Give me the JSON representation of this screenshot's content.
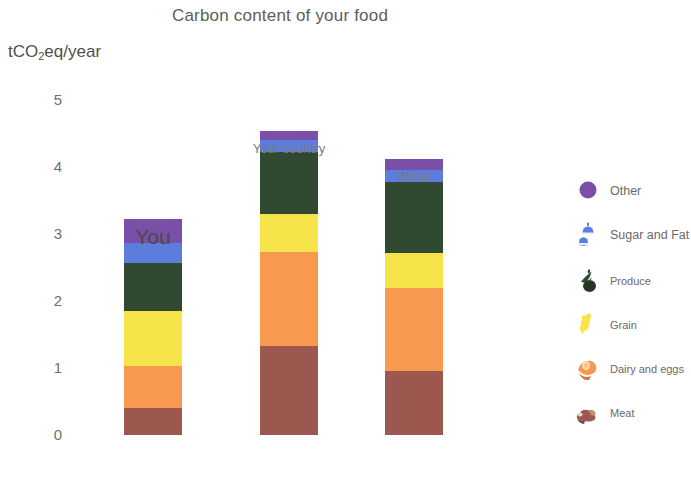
{
  "chart_data": {
    "type": "bar",
    "subtype": "stacked-bar",
    "title": "Carbon content of your food",
    "xlabel": "",
    "ylabel": "tCO2eq/year",
    "ylabel_parts": {
      "pre": "tCO",
      "sub": "2",
      "post": "eq/year"
    },
    "categories": [
      "You",
      "Your country",
      "World"
    ],
    "yticks": [
      0,
      1,
      2,
      3,
      4,
      5
    ],
    "ylim": [
      0,
      5
    ],
    "grid": false,
    "legend_position": "right",
    "stack_order_bottom_to_top": [
      "Meat",
      "Dairy and eggs",
      "Grain",
      "Produce",
      "Sugar and Fat",
      "Other"
    ],
    "series": [
      {
        "name": "Meat",
        "color": "#9c584f",
        "values": [
          0.4,
          1.33,
          0.95
        ]
      },
      {
        "name": "Dairy and eggs",
        "color": "#f79a4f",
        "values": [
          0.63,
          1.4,
          1.25
        ]
      },
      {
        "name": "Grain",
        "color": "#f7e44a",
        "values": [
          0.82,
          0.57,
          0.52
        ]
      },
      {
        "name": "Produce",
        "color": "#2f4a31",
        "values": [
          0.72,
          0.93,
          1.05
        ]
      },
      {
        "name": "Sugar and Fat",
        "color": "#5c7ddb",
        "values": [
          0.3,
          0.18,
          0.19
        ]
      },
      {
        "name": "Other",
        "color": "#7a4fa8",
        "values": [
          0.36,
          0.13,
          0.16
        ]
      }
    ],
    "totals": [
      3.25,
      4.57,
      4.13
    ]
  },
  "title": "Carbon content of your food",
  "axis": {
    "y_unit_pre": "tCO",
    "y_unit_sub": "2",
    "y_unit_post": "eq/year",
    "ticks": [
      "5",
      "4",
      "3",
      "2",
      "1",
      "0"
    ]
  },
  "bars": [
    {
      "label": "You"
    },
    {
      "label": "Your country"
    },
    {
      "label": "World"
    }
  ],
  "legend": {
    "items": [
      {
        "label": "Other",
        "icon": "other-circle-icon",
        "color": "#7a4fa8"
      },
      {
        "label": "Sugar and Fat",
        "icon": "sugar-and-fat-icon",
        "color": "#5c7ddb"
      },
      {
        "label": "Produce",
        "icon": "produce-icon",
        "color": "#2f4a31"
      },
      {
        "label": "Grain",
        "icon": "grain-icon",
        "color": "#f7e44a"
      },
      {
        "label": "Dairy and eggs",
        "icon": "dairy-and-eggs-icon",
        "color": "#f79a4f"
      },
      {
        "label": "Meat",
        "icon": "meat-icon",
        "color": "#9c584f"
      }
    ]
  }
}
